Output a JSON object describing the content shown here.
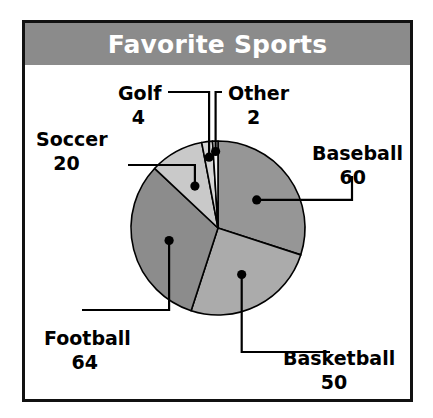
{
  "chart_title": "Favorite Sports",
  "title_bar_color": "#8b8b8b",
  "title_text_color": "#ffffff",
  "frame_border_color": "#111111",
  "background_color": "#ffffff",
  "chart_data": {
    "type": "pie",
    "title": "Favorite Sports",
    "categories": [
      "Baseball",
      "Basketball",
      "Football",
      "Soccer",
      "Golf",
      "Other"
    ],
    "values": [
      60,
      50,
      64,
      20,
      4,
      2
    ],
    "total": 200,
    "start_angle_deg": 0,
    "direction": "clockwise",
    "slice_colors": [
      "#969696",
      "#ababab",
      "#8c8c8c",
      "#c9c9c9",
      "#d6d6d6",
      "#f2f2f2"
    ],
    "slice_stroke": "#000000",
    "leader_line_color": "#000000",
    "legend": "labels-with-leader-lines",
    "grid": false,
    "xlabel": "",
    "ylabel": "",
    "slices": [
      {
        "label": "Baseball",
        "value": 60,
        "percent": 30.0,
        "angle_deg": 108.0,
        "color": "#969696"
      },
      {
        "label": "Basketball",
        "value": 50,
        "percent": 25.0,
        "angle_deg": 90.0,
        "color": "#ababab"
      },
      {
        "label": "Football",
        "value": 64,
        "percent": 32.0,
        "angle_deg": 115.2,
        "color": "#8c8c8c"
      },
      {
        "label": "Soccer",
        "value": 20,
        "percent": 10.0,
        "angle_deg": 36.0,
        "color": "#c9c9c9"
      },
      {
        "label": "Golf",
        "value": 4,
        "percent": 2.0,
        "angle_deg": 7.2,
        "color": "#d6d6d6"
      },
      {
        "label": "Other",
        "value": 2,
        "percent": 1.0,
        "angle_deg": 3.6,
        "color": "#f2f2f2"
      }
    ]
  },
  "geometry": {
    "cx": 218,
    "cy": 228,
    "r": 87,
    "frame": {
      "x": 22,
      "y": 20,
      "w": 391,
      "h": 382
    },
    "titlebar_h": 42
  },
  "labels": {
    "baseball": {
      "name": "Baseball",
      "value": "60",
      "x": 312,
      "y": 160,
      "anchor": "start"
    },
    "basketball": {
      "name": "Basketball",
      "value": "50",
      "x": 283,
      "y": 365,
      "anchor": "start"
    },
    "football": {
      "name": "Football",
      "value": "64",
      "x": 44,
      "y": 345,
      "anchor": "start"
    },
    "soccer": {
      "name": "Soccer",
      "value": "20",
      "x": 36,
      "y": 146,
      "anchor": "start"
    },
    "golf": {
      "name": "Golf",
      "value": "4",
      "x": 118,
      "y": 100,
      "anchor": "start"
    },
    "other": {
      "name": "Other",
      "value": "2",
      "x": 228,
      "y": 100,
      "anchor": "start"
    }
  }
}
